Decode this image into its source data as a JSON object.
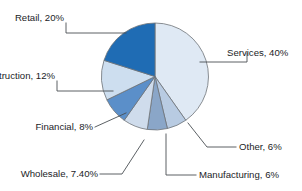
{
  "chart_data": {
    "type": "pie",
    "title": "",
    "subtitle": "",
    "xlabel": "",
    "ylabel": "",
    "legend_position": "none",
    "grid": false,
    "labels_show_percent": true,
    "start_angle_deg": 0,
    "direction": "clockwise",
    "categories": [
      "Services",
      "Other",
      "Manufacturing",
      "Wholesale",
      "Financial",
      "Construction",
      "Retail"
    ],
    "values": [
      40,
      6,
      6,
      7.4,
      8,
      12,
      20
    ],
    "colors": [
      "#dfe9f4",
      "#b8cbe2",
      "#8aa6c8",
      "#cfdcec",
      "#5b8fc9",
      "#cddeef",
      "#1f6cb4"
    ],
    "slices": [
      {
        "label": "Services, 40%",
        "name": "Services",
        "value": 40,
        "percent_text": "40%",
        "color": "#dfe9f4"
      },
      {
        "label": "Other, 6%",
        "name": "Other",
        "value": 6,
        "percent_text": "6%",
        "color": "#b8cbe2"
      },
      {
        "label": "Manufacturing, 6%",
        "name": "Manufacturing",
        "value": 6,
        "percent_text": "6%",
        "color": "#8aa6c8"
      },
      {
        "label": "Wholesale, 7.40%",
        "name": "Wholesale",
        "value": 7.4,
        "percent_text": "7.40%",
        "color": "#cfdcec"
      },
      {
        "label": "Financial, 8%",
        "name": "Financial",
        "value": 8,
        "percent_text": "8%",
        "color": "#5b8fc9"
      },
      {
        "label": "Construction, 12%",
        "name": "Construction",
        "value": 12,
        "percent_text": "12%",
        "color": "#cddeef"
      },
      {
        "label": "Retail, 20%",
        "name": "Retail",
        "value": 20,
        "percent_text": "20%",
        "color": "#1f6cb4"
      }
    ]
  },
  "labels": {
    "retail": "Retail, 20%",
    "services": "Services, 40%",
    "construction": "Construction, 12%",
    "financial": "Financial, 8%",
    "wholesale": "Wholesale, 7.40%",
    "manufacturing": "Manufacturing, 6%",
    "other": "Other, 6%"
  },
  "style": {
    "background": "#ffffff",
    "slice_border": "#6d7277",
    "leader_line": "#4a4f54",
    "text_color": "#1b1d1f"
  }
}
